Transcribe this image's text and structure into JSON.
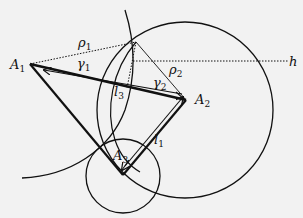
{
  "diagram": {
    "points": {
      "A1": {
        "label": "A",
        "sub": "1",
        "x": 30,
        "y": 64
      },
      "A2": {
        "label": "A",
        "sub": "2",
        "x": 186,
        "y": 100
      },
      "A3": {
        "label": "A",
        "sub": "3",
        "x": 123,
        "y": 175
      },
      "P": {
        "x": 136,
        "y": 42
      }
    },
    "labels": {
      "rho1": {
        "base": "ρ",
        "sub": "1"
      },
      "rho2": {
        "base": "ρ",
        "sub": "2"
      },
      "gamma1": {
        "base": "γ",
        "sub": "1"
      },
      "gamma2": {
        "base": "γ",
        "sub": "2"
      },
      "l1": {
        "base": "l",
        "sub": "1"
      },
      "l3": {
        "base": "l",
        "sub": "3"
      },
      "h": {
        "base": "h"
      }
    },
    "circles": [
      {
        "name": "large-circle",
        "cx": 185,
        "cy": 110,
        "r": 88
      },
      {
        "name": "small-circle",
        "cx": 123,
        "cy": 176,
        "r": 37
      }
    ],
    "colors": {
      "stroke": "#111111",
      "background": "#f2f2f2"
    }
  }
}
